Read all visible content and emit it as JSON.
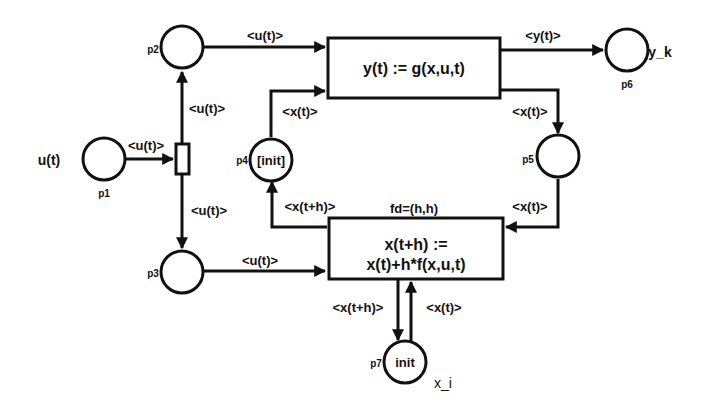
{
  "diagram": {
    "type": "petri-net",
    "places": [
      {
        "id": "p1",
        "name": "p1",
        "external_label": "u(t)",
        "token": ""
      },
      {
        "id": "p2",
        "name": "p2",
        "external_label": "",
        "token": ""
      },
      {
        "id": "p3",
        "name": "p3",
        "external_label": "",
        "token": ""
      },
      {
        "id": "p4",
        "name": "p4",
        "external_label": "",
        "token": "[init]"
      },
      {
        "id": "p5",
        "name": "p5",
        "external_label": "",
        "token": ""
      },
      {
        "id": "p6",
        "name": "p6",
        "external_label": "y_k",
        "token": ""
      },
      {
        "id": "p7",
        "name": "p7",
        "external_label": "x_i",
        "token": "init"
      }
    ],
    "transitions": [
      {
        "id": "t_split",
        "label": ""
      },
      {
        "id": "t_output",
        "label": "y(t) := g(x,u,t)"
      },
      {
        "id": "t_state",
        "label_line1": "x(t+h) :=",
        "label_line2": "x(t)+h*f(x,u,t)",
        "annotation": "fd=(h,h)"
      }
    ],
    "arcs": [
      {
        "from": "p1",
        "to": "t_split",
        "label": "<u(t)>"
      },
      {
        "from": "t_split",
        "to": "p2",
        "label": "<u(t)>"
      },
      {
        "from": "t_split",
        "to": "p3",
        "label": "<u(t)>"
      },
      {
        "from": "p2",
        "to": "t_output",
        "label": "<u(t)>"
      },
      {
        "from": "p4",
        "to": "t_output",
        "label": "<x(t)>"
      },
      {
        "from": "t_output",
        "to": "p6",
        "label": "<y(t)>"
      },
      {
        "from": "t_output",
        "to": "p5",
        "label": "<x(t)>"
      },
      {
        "from": "p5",
        "to": "t_state",
        "label": "<x(t)>"
      },
      {
        "from": "t_state",
        "to": "p4",
        "label": "<x(t+h)>"
      },
      {
        "from": "p3",
        "to": "t_state",
        "label": "<u(t)>"
      },
      {
        "from": "t_state",
        "to": "p7",
        "label": "<x(t+h)>"
      },
      {
        "from": "p7",
        "to": "t_state",
        "label": "<x(t)>"
      }
    ]
  }
}
